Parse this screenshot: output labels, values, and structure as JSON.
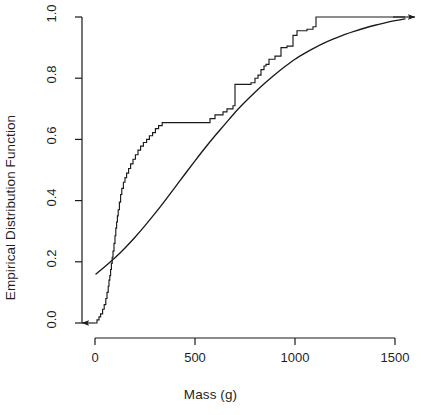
{
  "chart_data": {
    "type": "line",
    "title": "",
    "xlabel": "Mass (g)",
    "ylabel": "Empirical Distribution Function",
    "xlim": [
      -35,
      1550
    ],
    "ylim": [
      0,
      1
    ],
    "xticks": [
      0,
      500,
      1000,
      1500
    ],
    "xtick_labels": [
      "0",
      "500",
      "1000",
      "1500"
    ],
    "yticks": [
      0.0,
      0.2,
      0.4,
      0.6,
      0.8,
      1.0
    ],
    "ytick_labels": [
      "0.0",
      "0.2",
      "0.4",
      "0.6",
      "0.8",
      "1.0"
    ],
    "grid": false,
    "legend": "none",
    "axis_color": "#1a1a1a",
    "line_color": "#1a1a1a",
    "background": "#ffffff",
    "series": [
      {
        "name": "Empirical distribution function (step)",
        "type": "step",
        "style": "solid",
        "color": "#1a1a1a",
        "left_arrow_to_x": -65,
        "right_arrow_to_x": 1550,
        "points": [
          [
            0,
            0.0
          ],
          [
            10,
            0.01
          ],
          [
            20,
            0.02
          ],
          [
            28,
            0.03
          ],
          [
            38,
            0.045
          ],
          [
            46,
            0.06
          ],
          [
            54,
            0.08
          ],
          [
            60,
            0.1
          ],
          [
            66,
            0.12
          ],
          [
            70,
            0.14
          ],
          [
            74,
            0.155
          ],
          [
            78,
            0.175
          ],
          [
            82,
            0.195
          ],
          [
            86,
            0.215
          ],
          [
            90,
            0.235
          ],
          [
            95,
            0.26
          ],
          [
            100,
            0.285
          ],
          [
            104,
            0.31
          ],
          [
            108,
            0.33
          ],
          [
            112,
            0.35
          ],
          [
            116,
            0.37
          ],
          [
            122,
            0.395
          ],
          [
            128,
            0.42
          ],
          [
            134,
            0.44
          ],
          [
            142,
            0.46
          ],
          [
            150,
            0.475
          ],
          [
            158,
            0.49
          ],
          [
            168,
            0.505
          ],
          [
            178,
            0.52
          ],
          [
            190,
            0.535
          ],
          [
            202,
            0.55
          ],
          [
            215,
            0.565
          ],
          [
            228,
            0.578
          ],
          [
            242,
            0.59
          ],
          [
            258,
            0.6
          ],
          [
            272,
            0.612
          ],
          [
            288,
            0.622
          ],
          [
            302,
            0.635
          ],
          [
            318,
            0.645
          ],
          [
            336,
            0.655
          ],
          [
            350,
            0.655
          ],
          [
            560,
            0.655
          ],
          [
            575,
            0.668
          ],
          [
            600,
            0.68
          ],
          [
            640,
            0.69
          ],
          [
            660,
            0.7
          ],
          [
            690,
            0.71
          ],
          [
            700,
            0.78
          ],
          [
            780,
            0.785
          ],
          [
            800,
            0.8
          ],
          [
            815,
            0.81
          ],
          [
            830,
            0.828
          ],
          [
            845,
            0.84
          ],
          [
            855,
            0.845
          ],
          [
            870,
            0.862
          ],
          [
            900,
            0.872
          ],
          [
            930,
            0.9
          ],
          [
            960,
            0.905
          ],
          [
            990,
            0.94
          ],
          [
            1010,
            0.955
          ],
          [
            1060,
            0.96
          ],
          [
            1090,
            0.968
          ],
          [
            1105,
            1.0
          ],
          [
            1550,
            1.0
          ]
        ]
      },
      {
        "name": "Fitted theoretical distribution (smooth)",
        "type": "smooth",
        "style": "solid",
        "color": "#1a1a1a",
        "points": [
          [
            5,
            0.16
          ],
          [
            50,
            0.185
          ],
          [
            100,
            0.213
          ],
          [
            150,
            0.245
          ],
          [
            200,
            0.28
          ],
          [
            250,
            0.318
          ],
          [
            300,
            0.358
          ],
          [
            350,
            0.4
          ],
          [
            400,
            0.443
          ],
          [
            450,
            0.487
          ],
          [
            500,
            0.53
          ],
          [
            550,
            0.572
          ],
          [
            600,
            0.612
          ],
          [
            650,
            0.65
          ],
          [
            700,
            0.688
          ],
          [
            750,
            0.722
          ],
          [
            800,
            0.754
          ],
          [
            850,
            0.784
          ],
          [
            900,
            0.812
          ],
          [
            950,
            0.838
          ],
          [
            1000,
            0.862
          ],
          [
            1050,
            0.882
          ],
          [
            1100,
            0.9
          ],
          [
            1150,
            0.916
          ],
          [
            1200,
            0.93
          ],
          [
            1250,
            0.943
          ],
          [
            1300,
            0.954
          ],
          [
            1350,
            0.964
          ],
          [
            1400,
            0.973
          ],
          [
            1450,
            0.981
          ],
          [
            1500,
            0.988
          ],
          [
            1550,
            0.994
          ]
        ]
      }
    ]
  }
}
